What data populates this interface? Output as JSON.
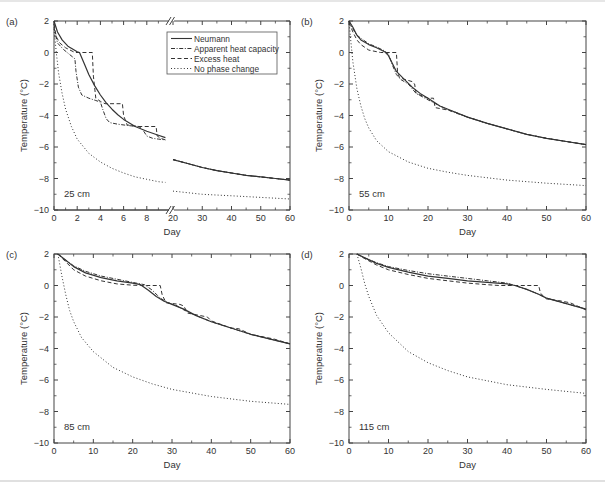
{
  "figure": {
    "legend": {
      "entries": [
        {
          "label": "Neumann",
          "style": "solid"
        },
        {
          "label": "Apparent heat capacity",
          "style": "dashdot"
        },
        {
          "label": "Excess heat",
          "style": "dashed"
        },
        {
          "label": "No phase change",
          "style": "dotted"
        }
      ]
    },
    "colors": {
      "line": "#333333",
      "axis": "#444444",
      "text": "#333333"
    }
  },
  "chart_data": [
    {
      "type": "line",
      "panel_label": "(a)",
      "annotation": "25 cm",
      "xlabel": "Day",
      "ylabel": "Temperature (°C)",
      "ylim": [
        -10,
        2
      ],
      "yticks": [
        2,
        0,
        -2,
        -4,
        -6,
        -8,
        -10
      ],
      "xaxis_broken": true,
      "xlim_segments": [
        [
          0,
          10
        ],
        [
          20,
          60
        ]
      ],
      "xticks": [
        0,
        2,
        4,
        6,
        8,
        20,
        30,
        40,
        50,
        60
      ],
      "legend_position": "upper right",
      "grid": false,
      "series": [
        {
          "name": "Neumann",
          "style": "solid",
          "x": [
            0,
            0.3,
            0.7,
            1.2,
            2,
            2.2,
            2.6,
            3,
            3.5,
            4,
            4.5,
            5,
            5.5,
            6,
            7,
            8,
            9,
            9.6,
            20,
            25,
            30,
            35,
            40,
            45,
            50,
            55,
            60
          ],
          "y": [
            2,
            1.3,
            0.8,
            0.4,
            0.05,
            0,
            -0.7,
            -1.4,
            -2.1,
            -2.7,
            -3.2,
            -3.6,
            -3.95,
            -4.25,
            -4.7,
            -5.0,
            -5.25,
            -5.4,
            -6.8,
            -7.05,
            -7.3,
            -7.5,
            -7.65,
            -7.8,
            -7.9,
            -8.0,
            -8.1
          ]
        },
        {
          "name": "Apparent heat capacity",
          "style": "dashdot",
          "x": [
            0,
            0.3,
            0.8,
            1.3,
            1.8,
            1.9,
            2.1,
            2.4,
            3,
            3.6,
            4.0,
            4.2,
            4.5,
            4.8,
            5.5,
            6.5,
            7.3,
            7.6,
            8,
            8.5,
            9,
            9.6,
            20,
            25,
            30,
            35,
            40,
            45,
            50,
            55,
            60
          ],
          "y": [
            1.6,
            0.6,
            0.2,
            -0.1,
            -0.4,
            -1.2,
            -2.2,
            -2.7,
            -2.9,
            -3.05,
            -3.15,
            -3.6,
            -4.2,
            -4.45,
            -4.55,
            -4.65,
            -4.7,
            -4.85,
            -5.3,
            -5.45,
            -5.5,
            -5.55,
            -6.8,
            -7.05,
            -7.3,
            -7.5,
            -7.65,
            -7.8,
            -7.9,
            -8.0,
            -8.1
          ]
        },
        {
          "name": "Excess heat",
          "style": "dashed",
          "x": [
            0,
            0.2,
            0.5,
            1.0,
            1.8,
            3.3,
            3.4,
            3.6,
            4.0,
            4.4,
            5.9,
            6.0,
            6.3,
            7.2,
            8.8,
            8.9,
            9.2,
            9.6,
            20,
            25,
            30,
            35,
            40,
            45,
            50,
            55,
            60
          ],
          "y": [
            1.8,
            1.0,
            0.6,
            0.3,
            0,
            0,
            -1.5,
            -2.9,
            -3.1,
            -3.25,
            -3.25,
            -4.0,
            -4.6,
            -4.7,
            -4.7,
            -5.3,
            -5.45,
            -5.55,
            -6.8,
            -7.05,
            -7.3,
            -7.5,
            -7.65,
            -7.8,
            -7.9,
            -8.0,
            -8.1
          ]
        },
        {
          "name": "No phase change",
          "style": "dotted",
          "x": [
            0,
            0.2,
            0.4,
            0.7,
            1,
            1.5,
            2,
            3,
            4,
            5,
            6,
            7,
            8,
            9,
            9.6,
            20,
            30,
            40,
            50,
            60
          ],
          "y": [
            1.5,
            0,
            -1.3,
            -2.6,
            -3.6,
            -4.7,
            -5.5,
            -6.4,
            -6.95,
            -7.35,
            -7.65,
            -7.9,
            -8.05,
            -8.2,
            -8.25,
            -8.8,
            -9.0,
            -9.1,
            -9.2,
            -9.3
          ]
        }
      ]
    },
    {
      "type": "line",
      "panel_label": "(b)",
      "annotation": "55 cm",
      "xlabel": "Day",
      "ylabel": "Temperature (°C)",
      "ylim": [
        -10,
        2
      ],
      "xlim": [
        0,
        60
      ],
      "yticks": [
        2,
        0,
        -2,
        -4,
        -6,
        -8,
        -10
      ],
      "xticks": [
        0,
        10,
        20,
        30,
        40,
        50,
        60
      ],
      "grid": false,
      "series": [
        {
          "name": "Neumann",
          "style": "solid",
          "x": [
            0,
            1,
            2,
            3,
            5,
            7,
            9,
            10,
            11,
            12,
            14,
            16,
            18,
            20,
            23,
            26,
            30,
            35,
            40,
            45,
            50,
            55,
            60
          ],
          "y": [
            2,
            1.6,
            1.1,
            0.8,
            0.5,
            0.3,
            0.05,
            -0.2,
            -0.7,
            -1.2,
            -1.7,
            -2.2,
            -2.6,
            -2.9,
            -3.4,
            -3.7,
            -4.1,
            -4.5,
            -4.85,
            -5.2,
            -5.45,
            -5.65,
            -5.85
          ]
        },
        {
          "name": "Apparent heat capacity",
          "style": "dashdot",
          "x": [
            0,
            1,
            2,
            3,
            5,
            7,
            9,
            10,
            11,
            12,
            13,
            15,
            17,
            20,
            23,
            26,
            30,
            35,
            40,
            45,
            50,
            55,
            60
          ],
          "y": [
            2,
            1.5,
            1.1,
            0.9,
            0.55,
            0.35,
            0.1,
            -0.1,
            -0.8,
            -1.4,
            -1.7,
            -2.0,
            -2.6,
            -3.0,
            -3.4,
            -3.75,
            -4.1,
            -4.5,
            -4.85,
            -5.2,
            -5.45,
            -5.65,
            -5.85
          ]
        },
        {
          "name": "Excess heat",
          "style": "dashed",
          "x": [
            0,
            1,
            2,
            3,
            5,
            8,
            9,
            12,
            12.3,
            12.8,
            14,
            16,
            16.6,
            17,
            20,
            21.4,
            21.8,
            26,
            27,
            30,
            35,
            40,
            45,
            50,
            55,
            60
          ],
          "y": [
            1.9,
            1.3,
            0.8,
            0.5,
            0.15,
            0,
            0,
            0,
            -1.3,
            -1.6,
            -1.7,
            -1.85,
            -2.0,
            -2.6,
            -2.9,
            -2.9,
            -3.5,
            -3.7,
            -3.8,
            -4.1,
            -4.5,
            -4.85,
            -5.2,
            -5.45,
            -5.65,
            -5.85
          ]
        },
        {
          "name": "No phase change",
          "style": "dotted",
          "x": [
            0,
            0.5,
            1,
            2,
            3,
            4,
            5,
            7,
            10,
            15,
            20,
            25,
            30,
            40,
            50,
            60
          ],
          "y": [
            2,
            0.6,
            -0.6,
            -2.3,
            -3.4,
            -4.2,
            -4.8,
            -5.6,
            -6.3,
            -6.95,
            -7.35,
            -7.6,
            -7.8,
            -8.1,
            -8.3,
            -8.45
          ]
        }
      ]
    },
    {
      "type": "line",
      "panel_label": "(c)",
      "annotation": "85 cm",
      "xlabel": "Day",
      "ylabel": "Temperature (°C)",
      "ylim": [
        -10,
        2
      ],
      "xlim": [
        0,
        60
      ],
      "yticks": [
        2,
        0,
        -2,
        -4,
        -6,
        -8,
        -10
      ],
      "xticks": [
        0,
        10,
        20,
        30,
        40,
        50,
        60
      ],
      "grid": false,
      "series": [
        {
          "name": "Neumann",
          "style": "solid",
          "x": [
            1,
            3,
            5,
            8,
            12,
            16,
            20,
            22,
            24,
            26,
            28,
            30,
            33,
            36,
            40,
            45,
            50,
            55,
            60
          ],
          "y": [
            2,
            1.6,
            1.2,
            0.8,
            0.5,
            0.3,
            0.15,
            0.05,
            -0.3,
            -0.7,
            -1.0,
            -1.2,
            -1.5,
            -1.9,
            -2.3,
            -2.7,
            -3.1,
            -3.4,
            -3.7
          ]
        },
        {
          "name": "Apparent heat capacity",
          "style": "dashdot",
          "x": [
            1,
            3,
            5,
            8,
            12,
            16,
            20,
            23,
            25,
            27,
            29,
            31,
            33,
            36,
            40,
            45,
            50,
            55,
            60
          ],
          "y": [
            2,
            1.6,
            1.25,
            0.9,
            0.6,
            0.4,
            0.2,
            0.05,
            -0.3,
            -0.8,
            -1.1,
            -1.25,
            -1.55,
            -1.9,
            -2.3,
            -2.7,
            -3.1,
            -3.4,
            -3.7
          ]
        },
        {
          "name": "Excess heat",
          "style": "dashed",
          "x": [
            1,
            3,
            5,
            8,
            12,
            16,
            20,
            22,
            27,
            27.5,
            28.5,
            32,
            33,
            34,
            39,
            40,
            45,
            47,
            50,
            54,
            56,
            60
          ],
          "y": [
            2,
            1.5,
            1.0,
            0.6,
            0.3,
            0.1,
            0.02,
            0,
            0,
            -0.6,
            -1.1,
            -1.2,
            -1.3,
            -1.75,
            -2.0,
            -2.25,
            -2.7,
            -2.75,
            -3.1,
            -3.3,
            -3.4,
            -3.7
          ]
        },
        {
          "name": "No phase change",
          "style": "dotted",
          "x": [
            1,
            2,
            3,
            4,
            5,
            7,
            10,
            15,
            20,
            25,
            30,
            40,
            50,
            60
          ],
          "y": [
            2,
            0.6,
            -0.6,
            -1.6,
            -2.3,
            -3.3,
            -4.2,
            -5.2,
            -5.8,
            -6.25,
            -6.6,
            -7.05,
            -7.35,
            -7.55
          ]
        }
      ]
    },
    {
      "type": "line",
      "panel_label": "(d)",
      "annotation": "115 cm",
      "xlabel": "Day",
      "ylabel": "Temperature (°C)",
      "ylim": [
        -10,
        2
      ],
      "xlim": [
        0,
        60
      ],
      "yticks": [
        2,
        0,
        -2,
        -4,
        -6,
        -8,
        -10
      ],
      "xticks": [
        0,
        10,
        20,
        30,
        40,
        50,
        60
      ],
      "grid": false,
      "series": [
        {
          "name": "Neumann",
          "style": "solid",
          "x": [
            2,
            4,
            7,
            10,
            15,
            20,
            25,
            30,
            35,
            40,
            42,
            45,
            48,
            50,
            55,
            60
          ],
          "y": [
            2,
            1.75,
            1.4,
            1.15,
            0.85,
            0.6,
            0.45,
            0.3,
            0.2,
            0.1,
            0.0,
            -0.25,
            -0.55,
            -0.8,
            -1.15,
            -1.5
          ]
        },
        {
          "name": "Apparent heat capacity",
          "style": "dashdot",
          "x": [
            2,
            4,
            7,
            10,
            15,
            20,
            25,
            30,
            35,
            40,
            42,
            45,
            48,
            50,
            55,
            60
          ],
          "y": [
            2,
            1.75,
            1.45,
            1.2,
            0.95,
            0.75,
            0.6,
            0.45,
            0.3,
            0.15,
            0.0,
            -0.25,
            -0.55,
            -0.8,
            -1.15,
            -1.5
          ]
        },
        {
          "name": "Excess heat",
          "style": "dashed",
          "x": [
            2,
            4,
            7,
            10,
            15,
            20,
            25,
            30,
            35,
            38,
            48,
            48.5,
            50,
            53,
            56,
            60
          ],
          "y": [
            2,
            1.7,
            1.3,
            1.0,
            0.7,
            0.45,
            0.3,
            0.15,
            0.05,
            0,
            0,
            -0.5,
            -0.85,
            -0.95,
            -1.1,
            -1.55
          ]
        },
        {
          "name": "No phase change",
          "style": "dotted",
          "x": [
            2,
            3,
            4,
            5,
            7,
            10,
            15,
            20,
            25,
            30,
            40,
            50,
            60
          ],
          "y": [
            2,
            1.1,
            0.1,
            -0.7,
            -1.9,
            -3.0,
            -4.2,
            -4.9,
            -5.4,
            -5.8,
            -6.3,
            -6.6,
            -6.85
          ]
        }
      ]
    }
  ]
}
